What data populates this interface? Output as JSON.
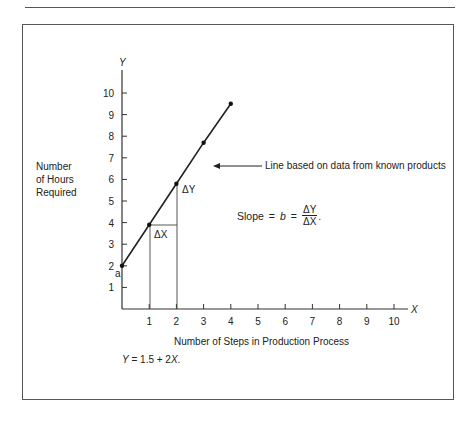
{
  "figure": {
    "y_axis_letter": "Y",
    "x_axis_letter": "X",
    "y_label_lines": [
      "Number",
      "of Hours",
      "Required"
    ],
    "x_label": "Number of Steps in Production Process",
    "annotation": "Line based on data from known products",
    "intercept_label": "a",
    "delta_y_label": "ΔY",
    "delta_x_label": "ΔX",
    "slope_text": "Slope",
    "slope_eq1": "=",
    "slope_b": "b",
    "slope_eq2": "=",
    "slope_num": "ΔY",
    "slope_den": "ΔX",
    "slope_period": ".",
    "equation_y": "Y",
    "equation_rest": " = 1.5 + 2",
    "equation_x": "X",
    "equation_end": "."
  },
  "chart_data": {
    "type": "line",
    "title": "",
    "xlabel": "Number of Steps in Production Process",
    "ylabel": "Number of Hours Required",
    "x_ticks": [
      1,
      2,
      3,
      4,
      5,
      6,
      7,
      8,
      9,
      10
    ],
    "y_ticks": [
      1,
      2,
      3,
      4,
      5,
      6,
      7,
      8,
      9,
      10
    ],
    "xlim": [
      0,
      10.5
    ],
    "ylim": [
      0,
      11
    ],
    "series": [
      {
        "name": "Line based on data from known products",
        "x": [
          0,
          1,
          2,
          3,
          4
        ],
        "y": [
          2,
          3.9,
          5.8,
          7.7,
          9.5
        ]
      }
    ],
    "annotations": [
      "a (intercept at Y=2)",
      "ΔY",
      "ΔX",
      "Slope = b = ΔY/ΔX",
      "Y = 1.5 + 2X"
    ],
    "grid": false,
    "legend": "none"
  }
}
